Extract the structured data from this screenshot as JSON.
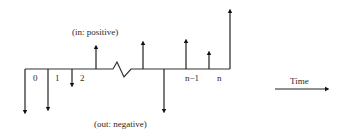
{
  "diagram": {
    "type": "cash-flow-timeline",
    "annotations": {
      "inflow": "(in: positive)",
      "outflow": "(out: negative)"
    },
    "time_axis_label": "Time",
    "period_labels": [
      "0",
      "1",
      "2",
      "n−1",
      "n"
    ],
    "colors": {
      "line": "#222222",
      "text": "#2a2a2a",
      "background": "#ffffff"
    },
    "flows": [
      {
        "x": 25,
        "direction": "down",
        "length": 43
      },
      {
        "x": 48,
        "direction": "down",
        "length": 40
      },
      {
        "x": 72,
        "direction": "down",
        "length": 16
      },
      {
        "x": 96,
        "direction": "up",
        "length": 22
      },
      {
        "x": 143,
        "direction": "up",
        "length": 26
      },
      {
        "x": 164,
        "direction": "down",
        "length": 42
      },
      {
        "x": 186,
        "direction": "up",
        "length": 28
      },
      {
        "x": 209,
        "direction": "up",
        "length": 16
      },
      {
        "x": 230,
        "direction": "up",
        "length": 58
      }
    ],
    "break_marker": "zigzag between period 2 and n-1"
  }
}
